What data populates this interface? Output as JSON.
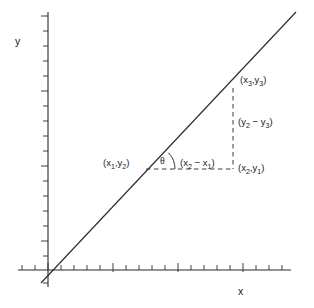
{
  "figure": {
    "axes": {
      "x_label": "x",
      "y_label": "y",
      "axis_color": "#2b2b2b",
      "tick_count_x": 21,
      "tick_count_y": 17
    },
    "line": {
      "color": "#2b2b2b",
      "description": "straight-line-through-origin"
    },
    "points": {
      "p1": "(x₁,y₂)",
      "p2": "(x₂,y₁)",
      "p3": "(x₃,y₃)"
    },
    "deltas": {
      "run": "(x₂ − x₁)",
      "rise": "(y₂ − y₃)"
    },
    "angle": {
      "symbol": "θ"
    },
    "labels": {
      "p1_parts": {
        "open": "(x",
        "s1": "1",
        "comma": ",y",
        "s2": "2",
        "close": ")"
      },
      "p2_parts": {
        "open": "(x",
        "s1": "2",
        "comma": ",y",
        "s2": "1",
        "close": ")"
      },
      "p3_parts": {
        "open": "(x",
        "s1": "3",
        "comma": ",y",
        "s2": "3",
        "close": ")"
      },
      "run_parts": {
        "open": "(x",
        "s1": "2",
        "mid": " − x",
        "s2": "1",
        "close": ")"
      },
      "rise_parts": {
        "open": "(y",
        "s1": "2",
        "mid": " − y",
        "s2": "3",
        "close": ")"
      }
    }
  }
}
